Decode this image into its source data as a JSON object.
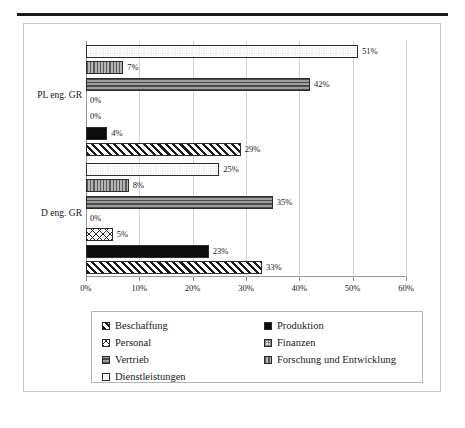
{
  "figure": {
    "top_rule": true,
    "frame": true
  },
  "chart_data": {
    "type": "bar",
    "orientation": "horizontal",
    "title": "",
    "subtitle": "",
    "xlabel": "",
    "ylabel": "",
    "grid": true,
    "legend_position": "bottom",
    "xlim": [
      0,
      60
    ],
    "xticks": [
      0,
      10,
      20,
      30,
      40,
      50,
      60
    ],
    "xtick_labels": [
      "0%",
      "10%",
      "20%",
      "30%",
      "40%",
      "50%",
      "60%"
    ],
    "categories": [
      "PL eng. GR",
      "D eng. GR"
    ],
    "series": [
      {
        "name": "Beschaffung",
        "pattern": "diagonal-stripes",
        "values": [
          29,
          33
        ],
        "labels": [
          "29%",
          "33%"
        ]
      },
      {
        "name": "Produktion",
        "pattern": "solid-black",
        "values": [
          4,
          23
        ],
        "labels": [
          "4%",
          "23%"
        ]
      },
      {
        "name": "Personal",
        "pattern": "cross-hatch-diamond",
        "values": [
          0,
          5
        ],
        "labels": [
          "0%",
          "5%"
        ]
      },
      {
        "name": "Finanzen",
        "pattern": "fine-grid",
        "values": [
          0,
          0
        ],
        "labels": [
          "0%",
          "0%"
        ]
      },
      {
        "name": "Vertrieb",
        "pattern": "horizontal-stripes",
        "values": [
          42,
          35
        ],
        "labels": [
          "42%",
          "35%"
        ]
      },
      {
        "name": "Forschung und Entwicklung",
        "pattern": "vertical-stripes",
        "values": [
          7,
          8
        ],
        "labels": [
          "7%",
          "8%"
        ]
      },
      {
        "name": "Dienstleistungen",
        "pattern": "light-dotted",
        "values": [
          51,
          25
        ],
        "labels": [
          "51%",
          "25%"
        ]
      }
    ]
  },
  "legend": {
    "items": [
      {
        "label": "Beschaffung",
        "swatch": "p-beschaffung"
      },
      {
        "label": "Produktion",
        "swatch": "p-produktion"
      },
      {
        "label": "Personal",
        "swatch": "p-personal"
      },
      {
        "label": "Finanzen",
        "swatch": "p-finanzen"
      },
      {
        "label": "Vertrieb",
        "swatch": "p-vertrieb"
      },
      {
        "label": "Forschung und Entwicklung",
        "swatch": "p-fue"
      },
      {
        "label": "Dienstleistungen",
        "swatch": "p-dienstleistungen"
      }
    ]
  }
}
